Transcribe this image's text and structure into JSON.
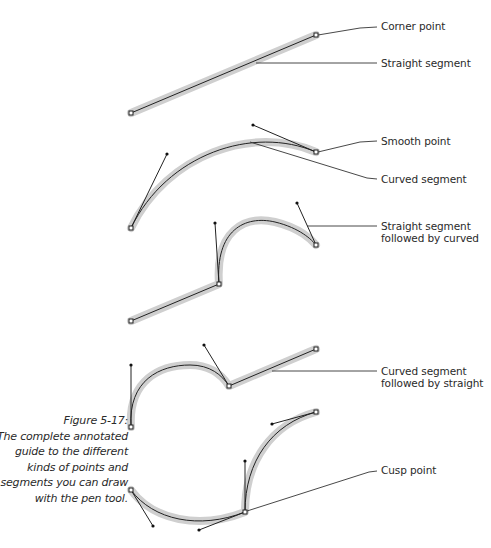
{
  "labels": {
    "corner_point": "Corner point",
    "straight_segment": "Straight segment",
    "smooth_point": "Smooth point",
    "curved_segment": "Curved segment",
    "straight_then_curved": "Straight segment\nfollowed by curved",
    "curved_then_straight": "Curved segment\nfollowed by straight",
    "cusp_point": "Cusp point"
  },
  "caption": {
    "figure_number": "Figure 5-17:",
    "text": "The complete annotated guide to the different kinds of points and segments you can draw with the pen tool."
  },
  "colors": {
    "halo": "#cfcfcf",
    "path": "#222222",
    "text": "#2a2a2a"
  }
}
